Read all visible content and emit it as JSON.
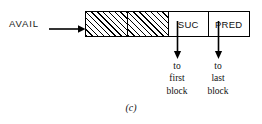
{
  "figure": {
    "pointer_label": "AVAIL",
    "caption": "(c)",
    "cells": [
      {
        "name": "hatched-cell-1",
        "label": "",
        "hatched": true
      },
      {
        "name": "hatched-cell-2",
        "label": "",
        "hatched": true
      },
      {
        "name": "suc-cell",
        "label": "SUC",
        "hatched": false
      },
      {
        "name": "pred-cell",
        "label": "PRED",
        "hatched": false
      }
    ],
    "annotations": [
      {
        "source": "SUC",
        "lines": [
          "to",
          "first",
          "block"
        ]
      },
      {
        "source": "PRED",
        "lines": [
          "to",
          "last",
          "block"
        ]
      }
    ],
    "colors": {
      "stroke": "#000000",
      "text": "#111111",
      "background": "#ffffff"
    }
  }
}
